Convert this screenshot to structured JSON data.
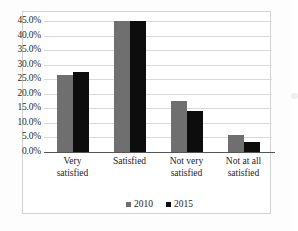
{
  "chart_data": {
    "type": "bar",
    "title": "",
    "subtitle": "",
    "xlabel": "",
    "ylabel": "",
    "categories": [
      "Very satisfied",
      "Satisfied",
      "Not very satisfied",
      "Not at all satisfied"
    ],
    "category_lines": [
      [
        "Very",
        "satisfied"
      ],
      [
        "Satisfied",
        ""
      ],
      [
        "Not very",
        "satisfied"
      ],
      [
        "Not at all",
        "satisfied"
      ]
    ],
    "series": [
      {
        "name": "2010",
        "color": "#6f6f6f",
        "values": [
          26.3,
          45.0,
          17.5,
          6.0
        ]
      },
      {
        "name": "2015",
        "color": "#0d0d0d",
        "values": [
          27.4,
          45.0,
          14.2,
          3.3
        ]
      }
    ],
    "ylim": [
      0,
      45
    ],
    "ytick_step": 5,
    "ytick_labels": [
      "0.0%",
      "5.0%",
      "10.0%",
      "15.0%",
      "20.0%",
      "25.0%",
      "30.0%",
      "35.0%",
      "40.0%",
      "45.0%"
    ],
    "ytick_values": [
      0,
      5,
      10,
      15,
      20,
      25,
      30,
      35,
      40,
      45
    ],
    "value_suffix": "%",
    "grid": true,
    "grid_axis": "y",
    "legend": true,
    "legend_position": "bottom",
    "legend_entries": [
      {
        "label": "2010",
        "color": "#6f6f6f"
      },
      {
        "label": "2015",
        "color": "#0d0d0d"
      }
    ]
  },
  "figure": {
    "background_color": "#ffffff",
    "border_color": "#d2d2d2",
    "gridline_color": "#d9d9d9",
    "axis_color": "#555555",
    "text_color": "#1d1d1d"
  }
}
